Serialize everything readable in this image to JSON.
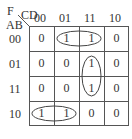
{
  "kmap": {
    "var_f": "F",
    "col_vars": "CD",
    "row_vars": "AB",
    "col_headers": [
      "00",
      "01",
      "11",
      "10"
    ],
    "row_headers": [
      "00",
      "01",
      "11",
      "10"
    ],
    "cells": [
      [
        "0",
        "1",
        "1",
        "0"
      ],
      [
        "0",
        "0",
        "1",
        "0"
      ],
      [
        "0",
        "0",
        "1",
        "0"
      ],
      [
        "1",
        "1",
        "0",
        "0"
      ]
    ],
    "groups": [
      {
        "name": "group-row00-cols01-11",
        "cells": [
          [
            0,
            1
          ],
          [
            0,
            2
          ]
        ]
      },
      {
        "name": "group-col11-rows01-11",
        "cells": [
          [
            1,
            2
          ],
          [
            2,
            2
          ]
        ]
      },
      {
        "name": "group-row10-cols00-01",
        "cells": [
          [
            3,
            0
          ],
          [
            3,
            1
          ]
        ]
      }
    ]
  }
}
